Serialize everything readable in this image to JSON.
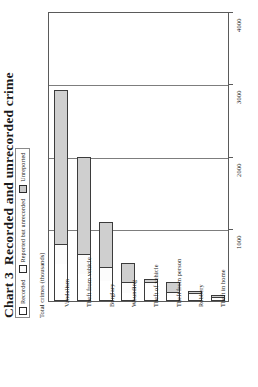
{
  "title": {
    "number": "Chart 3",
    "text": "Recorded and unrecorded crime"
  },
  "legend": {
    "items": [
      {
        "label": "Recorded",
        "color": "#ffffff"
      },
      {
        "label": "Reported but unrecorded",
        "color": "#fbfbfb"
      },
      {
        "label": "Unreported",
        "color": "#c9c9c9"
      }
    ]
  },
  "axis": {
    "y_title": "Total crimes (thousands)",
    "ticks": [
      "1000",
      "2000",
      "3000",
      "4000"
    ]
  },
  "chart_data": {
    "type": "bar",
    "title": "Chart 3  Recorded and unrecorded crime",
    "subtitle": "",
    "xlabel": "",
    "ylabel": "Total crimes (thousands)",
    "ylim": [
      0,
      4000
    ],
    "yticks": [
      0,
      1000,
      2000,
      3000,
      4000
    ],
    "grid": true,
    "stacked": true,
    "legend_position": "top-left",
    "orientation": "vertical",
    "categories": [
      "Vandalism",
      "Theft from vehicle",
      "Burglary",
      "Wounding",
      "Theft of vehicle",
      "Theft from person",
      "Robbery",
      "Theft in home"
    ],
    "series": [
      {
        "name": "Recorded",
        "values": [
          510,
          370,
          275,
          110,
          235,
          70,
          95,
          60
        ]
      },
      {
        "name": "Reported but unrecorded",
        "values": [
          275,
          280,
          195,
          160,
          45,
          60,
          25,
          15
        ]
      },
      {
        "name": "Unreported",
        "values": [
          2140,
          1350,
          630,
          255,
          20,
          130,
          20,
          10
        ]
      }
    ],
    "totals": [
      2925,
      2000,
      1100,
      525,
      300,
      260,
      140,
      85
    ]
  }
}
